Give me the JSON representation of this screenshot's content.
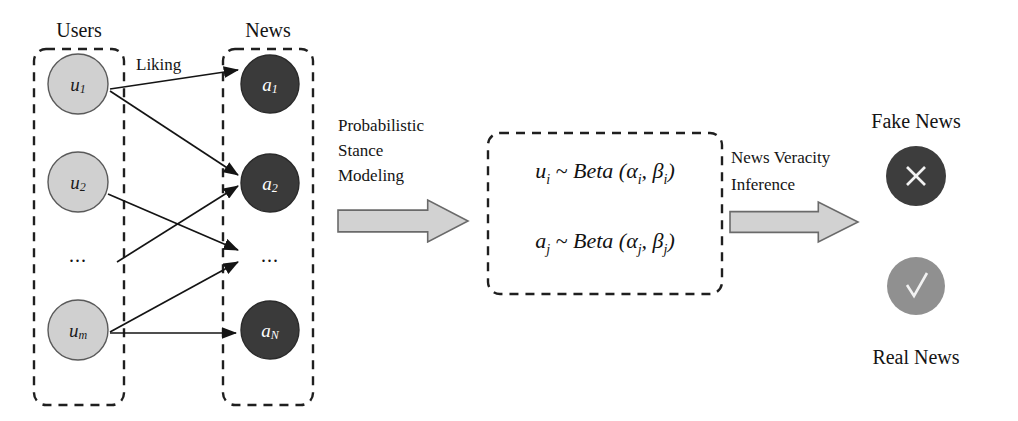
{
  "figure": {
    "type": "flow-diagram",
    "background": "#ffffff"
  },
  "groups": {
    "users": {
      "label": "Users",
      "box": {
        "x": 34,
        "y": 49,
        "w": 90,
        "h": 356
      },
      "node_fill": "#d0d0d0",
      "node_stroke": "#5a5a5a",
      "ellipsis": "...",
      "nodes": [
        {
          "base": "u",
          "sub": "1",
          "cx": 78,
          "cy": 84,
          "r": 30
        },
        {
          "base": "u",
          "sub": "2",
          "cx": 78,
          "cy": 182,
          "r": 30
        },
        {
          "base": "u",
          "sub": "m",
          "cx": 78,
          "cy": 330,
          "r": 30
        }
      ]
    },
    "news": {
      "label": "News",
      "box": {
        "x": 223,
        "y": 49,
        "w": 90,
        "h": 356
      },
      "node_fill": "#3a3a3a",
      "node_stroke": "#2a2a2a",
      "ellipsis": "...",
      "nodes": [
        {
          "base": "a",
          "sub": "1",
          "cx": 270,
          "cy": 84,
          "r": 29
        },
        {
          "base": "a",
          "sub": "2",
          "cx": 270,
          "cy": 183,
          "r": 29
        },
        {
          "base": "a",
          "sub": "N",
          "cx": 270,
          "cy": 330,
          "r": 29
        }
      ]
    }
  },
  "edges": {
    "label": "Liking",
    "label_pos": {
      "x": 136,
      "y": 70
    },
    "connections": [
      {
        "from": "u1",
        "to": "a1",
        "x1": 110,
        "y1": 89,
        "x2": 238,
        "y2": 70
      },
      {
        "from": "u1",
        "to": "a2",
        "x1": 110,
        "y1": 91,
        "x2": 238,
        "y2": 175
      },
      {
        "from": "u2",
        "to": "news-ellipsis",
        "x1": 108,
        "y1": 194,
        "x2": 238,
        "y2": 250
      },
      {
        "from": "users-ellipsis-row",
        "to": "a2",
        "x1": 117,
        "y1": 262,
        "x2": 238,
        "y2": 186
      },
      {
        "from": "um",
        "to": "news-ellipsis",
        "x1": 110,
        "y1": 332,
        "x2": 238,
        "y2": 262
      },
      {
        "from": "um",
        "to": "aN",
        "x1": 110,
        "y1": 333,
        "x2": 236,
        "y2": 333
      }
    ]
  },
  "stage1": {
    "label_lines": [
      "Probabilistic",
      "Stance",
      "Modeling"
    ],
    "label_pos": {
      "x": 338,
      "y": 131
    },
    "arrow": {
      "x": 338,
      "y": 200,
      "w": 130,
      "h": 42
    }
  },
  "model_box": {
    "box": {
      "x": 488,
      "y": 133,
      "w": 234,
      "h": 161
    },
    "formulas": [
      {
        "lhs_base": "u",
        "lhs_sub": "i",
        "rel": "~",
        "dist": "Beta",
        "p1_base": "α",
        "p1_sub": "i",
        "p2_base": "β",
        "p2_sub": "i",
        "text": "u i ~ Beta (α i , β i )",
        "cy": 178
      },
      {
        "lhs_base": "a",
        "lhs_sub": "j",
        "rel": "~",
        "dist": "Beta",
        "p1_base": "α",
        "p1_sub": "j",
        "p2_base": "β",
        "p2_sub": "j",
        "text": "a j ~ Beta (α j , β j )",
        "cy": 248
      }
    ]
  },
  "stage2": {
    "label_lines": [
      "News Veracity",
      "Inference"
    ],
    "label_pos": {
      "x": 731,
      "y": 163
    },
    "arrow": {
      "x": 730,
      "y": 202,
      "w": 128,
      "h": 40
    }
  },
  "outcomes": {
    "fake": {
      "label": "Fake News",
      "label_pos": {
        "x": 916,
        "y": 128
      },
      "circle": {
        "cx": 916,
        "cy": 176,
        "r": 30
      },
      "fill": "#3d3d3d",
      "mark": "x-mark"
    },
    "real": {
      "label": "Real News",
      "label_pos": {
        "x": 916,
        "y": 364
      },
      "circle": {
        "cx": 916,
        "cy": 286,
        "r": 29
      },
      "fill": "#909090",
      "mark": "check-mark"
    }
  },
  "colors": {
    "ink": "#141414",
    "user_node": "#d0d0d0",
    "news_node": "#3a3a3a",
    "fake_node": "#3d3d3d",
    "real_node": "#909090",
    "arrow_fill": "#d2d2d2",
    "arrow_stroke": "#6a6a6a"
  }
}
